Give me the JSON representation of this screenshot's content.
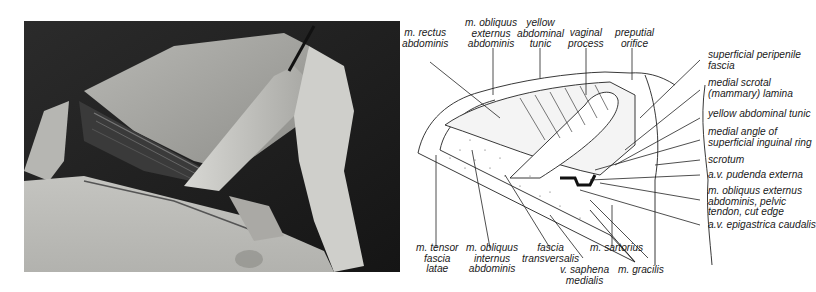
{
  "figure": {
    "photo": {
      "description": "dissection photograph of inguinal region",
      "tones": {
        "dark": "#1e1e1e",
        "mid": "#8a8a8a",
        "light": "#d4d4d0",
        "pale": "#c8c8c4"
      }
    },
    "diagram": {
      "labels_top": [
        {
          "id": "rectus",
          "text": "m. rectus\nabdominis"
        },
        {
          "id": "obliquus_ext",
          "text": "m. obliquus\nexternus\nabdominis"
        },
        {
          "id": "yellow_tunic_top",
          "text": "yellow\nabdominal\ntunic"
        },
        {
          "id": "vaginal",
          "text": "vaginal\nprocess"
        },
        {
          "id": "preputial",
          "text": "preputial\norifice"
        }
      ],
      "labels_right": [
        {
          "id": "peripenile",
          "text": "superficial peripenile\nfascia"
        },
        {
          "id": "scrotal",
          "text": "medial scrotal\n(mammary) lamina"
        },
        {
          "id": "yellow_tunic_right",
          "text": "yellow abdominal tunic"
        },
        {
          "id": "medial_angle",
          "text": "medial angle of\nsuperficial inguinal ring"
        },
        {
          "id": "scrotum",
          "text": "scrotum"
        },
        {
          "id": "pudenda",
          "text": "a.v. pudenda externa"
        },
        {
          "id": "obliquus_pelvic",
          "text": "m. obliquus externus\nabdominis, pelvic\ntendon, cut edge"
        },
        {
          "id": "epigastrica",
          "text": "a.v. epigastrica caudalis"
        }
      ],
      "labels_bottom": [
        {
          "id": "tensor",
          "text": "m. tensor\nfascia\nlatae"
        },
        {
          "id": "obliquus_int",
          "text": "m. obliquus\ninternus\nabdominis"
        },
        {
          "id": "transversalis",
          "text": "fascia\ntransversalis"
        },
        {
          "id": "saphena",
          "text": "v. saphena\nmedialis"
        },
        {
          "id": "sartorius",
          "text": "m. sartorius"
        },
        {
          "id": "gracilis",
          "text": "m. gracilis"
        }
      ]
    }
  }
}
